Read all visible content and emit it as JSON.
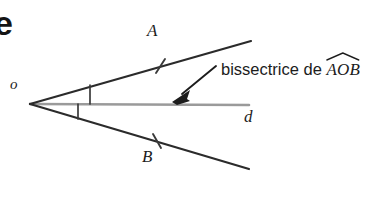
{
  "figure": {
    "kind": "geometry-diagram",
    "topic": "angle-bisector",
    "background_color": "#ffffff",
    "width": 379,
    "height": 204,
    "title_fragment": "e",
    "labels": {
      "vertex": "o",
      "ray_upper_point": "A",
      "ray_lower_point": "B",
      "bisector_line": "d"
    },
    "annotation": {
      "text_prefix": "bissectrice de ",
      "angle_name": "AOB",
      "has_angle_arc": true
    },
    "geometry": {
      "vertex": {
        "x": 30,
        "y": 104
      },
      "ray_oa_end": {
        "x": 251,
        "y": 41
      },
      "ray_ob_end": {
        "x": 249,
        "y": 169
      },
      "bisector_start": {
        "x": 30,
        "y": 104
      },
      "bisector_end": {
        "x": 249,
        "y": 105
      },
      "tick_on_oa": {
        "x": 160,
        "y": 66
      },
      "tick_on_ob": {
        "x": 157,
        "y": 141
      },
      "angle_mark_upper": {
        "x": 90,
        "y1": 85,
        "y2": 104
      },
      "angle_mark_lower": {
        "x": 78,
        "y1": 104,
        "y2": 119
      },
      "arrow_tail": {
        "x": 216,
        "y": 66
      },
      "arrow_head": {
        "x": 173,
        "y": 101
      }
    },
    "colors": {
      "ray_stroke": "#2b2b2b",
      "bisector_stroke": "#9a9a9a",
      "arrow_stroke": "#1c1c1c",
      "tick_stroke": "#3a3a3a",
      "text": "#1c1c1c"
    }
  }
}
